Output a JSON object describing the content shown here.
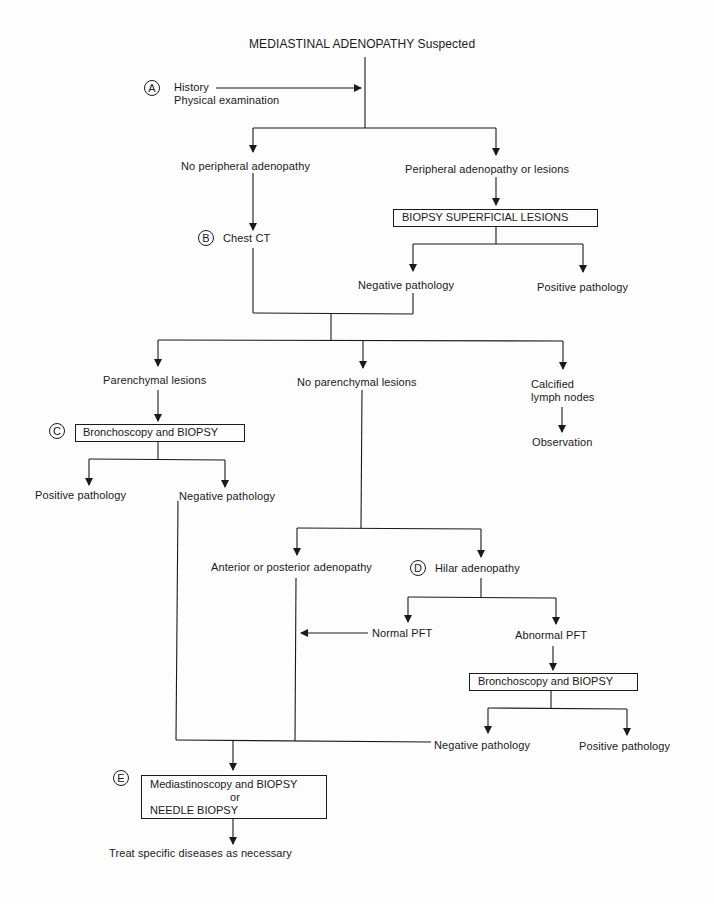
{
  "diagram": {
    "title": "MEDIASTINAL ADENOPATHY Suspected",
    "line_color": "#1a1a1a",
    "markers": {
      "a": "A",
      "b": "B",
      "c": "C",
      "d": "D",
      "e": "E"
    },
    "nodes": {
      "history": "History",
      "physical_exam": "Physical examination",
      "no_peripheral": "No peripheral adenopathy",
      "peripheral": "Peripheral adenopathy or lesions",
      "biopsy_superficial": "BIOPSY SUPERFICIAL LESIONS",
      "chest_ct": "Chest CT",
      "neg_path_1": "Negative pathology",
      "pos_path_1": "Positive pathology",
      "parenchymal": "Parenchymal lesions",
      "no_parenchymal": "No parenchymal lesions",
      "calcified_line1": "Calcified",
      "calcified_line2": "lymph nodes",
      "observation": "Observation",
      "bronch_biopsy_1": "Bronchoscopy and BIOPSY",
      "pos_path_2": "Positive pathology",
      "neg_path_2": "Negative pathology",
      "ant_post": "Anterior or posterior adenopathy",
      "hilar": "Hilar adenopathy",
      "normal_pft": "Normal PFT",
      "abnormal_pft": "Abnormal PFT",
      "bronch_biopsy_2": "Bronchoscopy and BIOPSY",
      "neg_path_3": "Negative pathology",
      "pos_path_3": "Positive pathology",
      "mediastinoscopy_line1": "Mediastinoscopy and BIOPSY",
      "mediastinoscopy_line2": "or",
      "mediastinoscopy_line3": "NEEDLE BIOPSY",
      "treat": "Treat specific diseases as necessary"
    }
  }
}
